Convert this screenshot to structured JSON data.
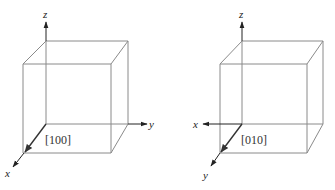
{
  "figures": [
    {
      "id": "cube-100",
      "direction_label": "[100]",
      "axes": {
        "z": "z",
        "y": "y",
        "x": "x"
      },
      "direction_axis": "x"
    },
    {
      "id": "cube-010",
      "direction_label": "[010]",
      "axes": {
        "z": "z",
        "x": "x",
        "y": "y"
      },
      "direction_axis": "y"
    }
  ],
  "colors": {
    "edge": "#8a8a8a",
    "axis": "#222222",
    "direction": "#333333",
    "background": "#ffffff"
  }
}
